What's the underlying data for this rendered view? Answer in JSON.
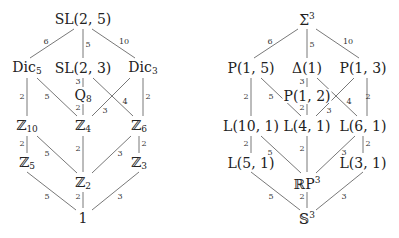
{
  "diagrams": [
    {
      "name": "group-lattice",
      "nodes": {
        "top": "SL(2, 5)",
        "dic5": "Dic",
        "dic5_sub": "5",
        "sl23": "SL(2, 3)",
        "dic3": "Dic",
        "dic3_sub": "3",
        "q8": "Q",
        "q8_sub": "8",
        "z10": "ℤ",
        "z10_sub": "10",
        "z4": "ℤ",
        "z4_sub": "4",
        "z6": "ℤ",
        "z6_sub": "6",
        "z5": "ℤ",
        "z5_sub": "5",
        "z3": "ℤ",
        "z3_sub": "3",
        "z2": "ℤ",
        "z2_sub": "2",
        "one": "1"
      },
      "edge_labels": [
        "6",
        "5",
        "10",
        "3",
        "2",
        "5",
        "4",
        "3",
        "2",
        "2",
        "2",
        "5",
        "2",
        "3",
        "2",
        "5",
        "2",
        "3"
      ]
    },
    {
      "name": "manifold-lattice",
      "nodes": {
        "top": "Σ",
        "top_sup": "3",
        "p15": "P(1, 5)",
        "delta1": "Δ(1)",
        "p13": "P(1, 3)",
        "p12": "P(1, 2)",
        "l101": "L(10, 1)",
        "l41": "L(4, 1)",
        "l61": "L(6, 1)",
        "l51": "L(5, 1)",
        "l31": "L(3, 1)",
        "rp3": "ℝP",
        "rp3_sup": "3",
        "s3": "𝕊",
        "s3_sup": "3"
      },
      "edge_labels": [
        "6",
        "5",
        "10",
        "3",
        "2",
        "5",
        "4",
        "3",
        "2",
        "2",
        "2",
        "5",
        "2",
        "3",
        "2",
        "5",
        "2",
        "3"
      ]
    }
  ]
}
